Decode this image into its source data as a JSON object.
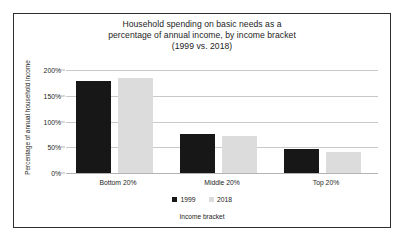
{
  "chart_data": {
    "type": "bar",
    "title": "Household spending on basic needs as a percentage of annual income, by income bracket (1999 vs. 2018)",
    "title_lines": [
      "Household spending on basic needs as a",
      "percentage of annual income, by income bracket",
      "(1999 vs. 2018)"
    ],
    "xlabel": "Income bracket",
    "ylabel": "Percentage of annual household income",
    "categories": [
      "Bottom 20%",
      "Middle 20%",
      "Top 20%"
    ],
    "series": [
      {
        "name": "1999",
        "color": "#171717",
        "values": [
          178,
          76,
          46
        ]
      },
      {
        "name": "2018",
        "color": "#dcdcdc",
        "values": [
          185,
          72,
          40
        ]
      }
    ],
    "ylim": [
      0,
      200
    ],
    "yticks": [
      0,
      50,
      100,
      150,
      200
    ],
    "ytick_labels": [
      "0%",
      "50%",
      "100%",
      "150%",
      "200%"
    ],
    "grid": true,
    "legend_position": "bottom",
    "legend_entries": [
      "1999",
      "2018"
    ],
    "frame": true,
    "background_color": "#ffffff",
    "frame_color": "#2e2e2e",
    "gridline_color": "#c9c9c9"
  }
}
